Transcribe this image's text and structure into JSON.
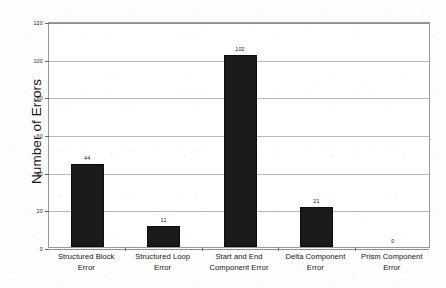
{
  "chart_data": {
    "type": "bar",
    "title": "",
    "xlabel": "",
    "ylabel": "Number of Errors",
    "ylim": [
      0,
      120
    ],
    "yticks": [
      0,
      20,
      40,
      60,
      80,
      100,
      120
    ],
    "ytick_labels": [
      "0",
      "20",
      "40",
      "60",
      "80",
      "100",
      "120"
    ],
    "grid": "horizontal",
    "legend": "none",
    "bar_color": "#1a1a1a",
    "categories": [
      "Structured Block Error",
      "Structured Loop Error",
      "Start and End Component Error",
      "Delta Component Error",
      "Prism Component Error"
    ],
    "category_lines": [
      [
        "Structured Block",
        "Error"
      ],
      [
        "Structured Loop",
        "Error"
      ],
      [
        "Start and End",
        "Component Error"
      ],
      [
        "Delta Component",
        "Error"
      ],
      [
        "Prism Component",
        "Error"
      ]
    ],
    "values": [
      44,
      11,
      102,
      21,
      0
    ],
    "value_labels": [
      "44",
      "11",
      "102",
      "21",
      "0"
    ]
  },
  "axis": {
    "y_title": "Number of Errors"
  }
}
